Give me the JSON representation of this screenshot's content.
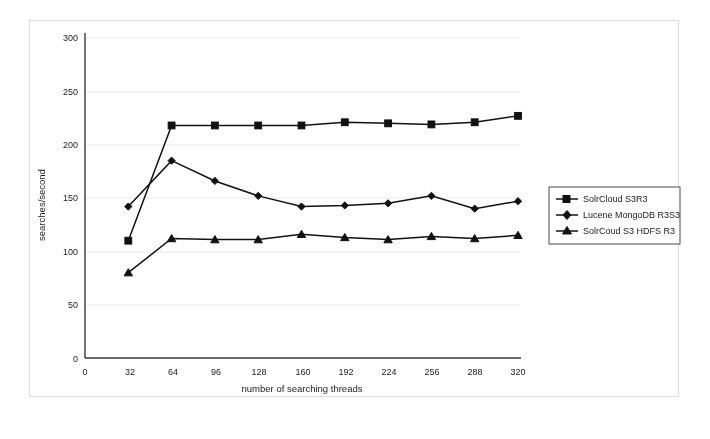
{
  "chart_data": {
    "type": "line",
    "title": "",
    "subtitle": "",
    "xlabel": "number of searching threads",
    "ylabel": "searches/second",
    "x": [
      32,
      64,
      96,
      128,
      160,
      192,
      224,
      256,
      288,
      320
    ],
    "xlim": [
      0,
      320
    ],
    "ylim": [
      0,
      300
    ],
    "xticks": [
      "0",
      "32",
      "64",
      "96",
      "128",
      "160",
      "192",
      "224",
      "256",
      "288",
      "320"
    ],
    "yticks": [
      "0",
      "50",
      "100",
      "150",
      "200",
      "250",
      "300"
    ],
    "grid": true,
    "grid_axis": "y",
    "legend_position": "right",
    "series": [
      {
        "name": "SolrCloud S3R3",
        "marker": "square",
        "values": [
          110,
          218,
          218,
          218,
          218,
          221,
          220,
          219,
          221,
          227
        ]
      },
      {
        "name": "Lucene  MongoDB R3S3",
        "marker": "diamond",
        "values": [
          142,
          185,
          166,
          152,
          142,
          143,
          145,
          152,
          140,
          147
        ]
      },
      {
        "name": "SolrCoud S3 HDFS R3",
        "marker": "triangle",
        "values": [
          80,
          112,
          111,
          111,
          116,
          113,
          111,
          114,
          112,
          115
        ]
      }
    ],
    "colors": {
      "series": "#111111",
      "axis": "#3a3a3a",
      "grid": "#e9e9e9",
      "background": "#ffffff"
    }
  }
}
